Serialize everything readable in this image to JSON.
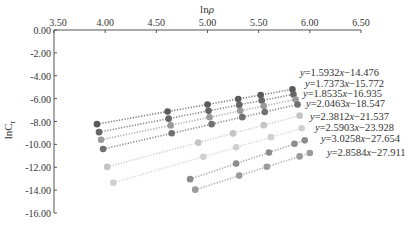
{
  "chart_data": {
    "type": "scatter",
    "title": "",
    "xlabel": "lnρ",
    "ylabel": "lnCr",
    "xlim": [
      3.5,
      6.5
    ],
    "ylim": [
      -16,
      0
    ],
    "x_ticks": [
      "3.50",
      "4.00",
      "4.50",
      "5.00",
      "5.50",
      "6.00",
      "6.50"
    ],
    "y_ticks": [
      "0.00",
      "-2.00",
      "-4.00",
      "-6.00",
      "-8.00",
      "-10.00",
      "-12.00",
      "-14.00",
      "-16.00"
    ],
    "x_axis_position": "top",
    "grid": false,
    "legend": "none",
    "series": [
      {
        "name": "y=1.5932x−14.476",
        "slope": 1.5932,
        "intercept": -14.476,
        "color": "#5a5a5a",
        "x": [
          3.92,
          4.61,
          5.0,
          5.3,
          5.52,
          5.83
        ],
        "y": [
          -8.23,
          -7.13,
          -6.51,
          -6.03,
          -5.68,
          -5.19
        ]
      },
      {
        "name": "y=1.7373x−15.772",
        "slope": 1.7373,
        "intercept": -15.772,
        "color": "#666666",
        "x": [
          3.94,
          4.62,
          5.01,
          5.31,
          5.53,
          5.84
        ],
        "y": [
          -8.93,
          -7.75,
          -7.07,
          -6.55,
          -6.17,
          -5.63
        ]
      },
      {
        "name": "y=1.8535x−16.935",
        "slope": 1.8535,
        "intercept": -16.935,
        "color": "#9a9a9a",
        "x": [
          3.96,
          4.64,
          5.02,
          5.32,
          5.55,
          5.86
        ],
        "y": [
          -9.6,
          -8.34,
          -7.63,
          -7.07,
          -6.65,
          -6.07
        ]
      },
      {
        "name": "y=2.0463x−18.547",
        "slope": 2.0463,
        "intercept": -18.547,
        "color": "#707070",
        "x": [
          3.98,
          4.65,
          5.04,
          5.34,
          5.56,
          5.88
        ],
        "y": [
          -10.4,
          -9.03,
          -8.23,
          -7.62,
          -7.17,
          -6.51
        ]
      },
      {
        "name": "y=2.3812x−21.537",
        "slope": 2.3812,
        "intercept": -21.537,
        "color": "#c4c4c4",
        "x": [
          4.02,
          4.91,
          5.25,
          5.55,
          5.9
        ],
        "y": [
          -11.97,
          -9.85,
          -9.04,
          -8.32,
          -7.49
        ]
      },
      {
        "name": "y=2.5903x−23.928",
        "slope": 2.5903,
        "intercept": -23.928,
        "color": "#cfcfcf",
        "x": [
          4.08,
          4.96,
          5.28,
          5.62,
          5.92
        ],
        "y": [
          -13.36,
          -11.08,
          -10.25,
          -9.37,
          -8.59
        ]
      },
      {
        "name": "y=3.0258x−27.654",
        "slope": 3.0258,
        "intercept": -27.654,
        "color": "#8c8c8c",
        "x": [
          4.83,
          5.28,
          5.6,
          5.85,
          5.95
        ],
        "y": [
          -13.04,
          -11.68,
          -10.71,
          -9.95,
          -9.65
        ]
      },
      {
        "name": "y=2.8584x−27.911",
        "slope": 2.8584,
        "intercept": -27.911,
        "color": "#9a9a9a",
        "x": [
          4.88,
          5.31,
          5.58,
          5.9,
          6.0
        ],
        "y": [
          -13.96,
          -12.73,
          -11.96,
          -11.05,
          -10.76
        ]
      }
    ],
    "annotations": [
      "y=1.5932x−14.476",
      "y=1.7373x−15.772",
      "y=1.8535x−16.935",
      "y=2.0463x−18.547",
      "y=2.3812x−21.537",
      "y=2.5903x−23.928",
      "y=3.0258x−27.654",
      "y=2.8584x−27.911"
    ]
  },
  "labels": {
    "xlabel_main": "ln",
    "xlabel_sym": "ρ",
    "ylabel_main": "lnC",
    "ylabel_sub": "r"
  },
  "equation_labels": [
    {
      "text": "y=1.5932x−14.476",
      "x": 300,
      "y": 76
    },
    {
      "text": "y=1.7373x−15.772",
      "x": 305,
      "y": 87
    },
    {
      "text": "y=1.8535x−16.935",
      "x": 303,
      "y": 97
    },
    {
      "text": "y=2.0463x−18.547",
      "x": 306,
      "y": 107
    },
    {
      "text": "y=2.3812x−21.537",
      "x": 310,
      "y": 120
    },
    {
      "text": "y=2.5903x−23.928",
      "x": 315,
      "y": 131
    },
    {
      "text": "y=3.0258x−27.654",
      "x": 321,
      "y": 142
    },
    {
      "text": "y=2.8584x−27.911",
      "x": 327,
      "y": 156
    }
  ]
}
